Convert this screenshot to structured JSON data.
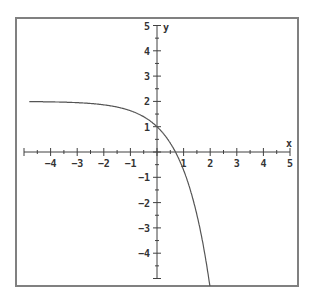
{
  "chart_data": {
    "type": "line",
    "title": "",
    "xlabel": "x",
    "ylabel": "y",
    "xlim": [
      -5,
      5
    ],
    "ylim": [
      -5,
      5
    ],
    "grid": false,
    "x_ticks": [
      -4,
      -3,
      -2,
      -1,
      1,
      2,
      3,
      4,
      5
    ],
    "y_ticks": [
      5,
      4,
      3,
      2,
      1,
      -1,
      -2,
      -3,
      -4
    ],
    "minor_ticks_per_unit": 2,
    "series": [
      {
        "name": "y = 2 - e^x",
        "x": [
          -4.8,
          -4,
          -3,
          -2,
          -1,
          -0.5,
          0,
          0.5,
          0.693,
          1,
          1.5,
          1.95
        ],
        "y": [
          1.99,
          1.98,
          1.95,
          1.86,
          1.63,
          1.39,
          1.0,
          0.35,
          0.0,
          -0.72,
          -2.48,
          -5.0
        ]
      }
    ],
    "annotations": {
      "horizontal_asymptote": 2,
      "y_intercept": 1,
      "x_intercept": 0.693
    }
  },
  "frame": {
    "left": 16,
    "top": 18,
    "right": 298,
    "bottom": 286
  },
  "origin_px": {
    "x": 157,
    "y": 152
  },
  "unit_px": {
    "x": 26.6,
    "y": 25.3
  },
  "colors": {
    "frame": "#808080",
    "axis": "#404040",
    "curve": "#555555",
    "text": "#333333"
  }
}
